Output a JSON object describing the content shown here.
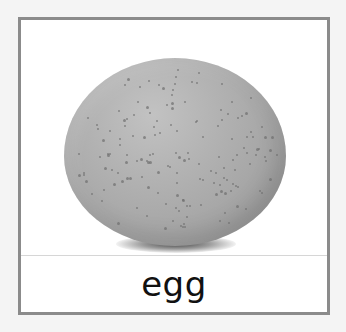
{
  "card": {
    "word": "egg",
    "image_subject": "speckled gray egg",
    "colors": {
      "frame_border": "#8b8b8b",
      "card_background": "#ffffff",
      "page_background": "#f4f4f4",
      "egg_gray": "#b0b0b0",
      "label_text": "#111111"
    }
  }
}
